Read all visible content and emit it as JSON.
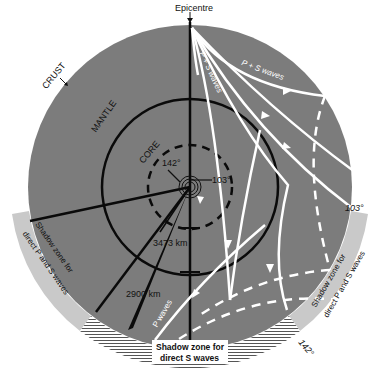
{
  "labels": {
    "epicentre": "Epicentre",
    "crust": "CRUST",
    "mantle": "MANTLE",
    "core": "CORE",
    "angle_142_inner": "142°",
    "angle_103_inner": "103°",
    "angle_103_outer": "103°",
    "angle_142_outer": "142°",
    "core_radius": "3473 km",
    "mantle_depth": "2900 km",
    "ps_waves_1": "P + S waves",
    "ps_waves_2": "P + S waves",
    "p_waves": "P waves",
    "shadow_ps_left_1": "Shadow zone for",
    "shadow_ps_left_2": "direct P and S waves",
    "shadow_ps_right_1": "Shadow zone for",
    "shadow_ps_right_2": "direct P and S waves",
    "shadow_s_1": "Shadow zone for",
    "shadow_s_2": "direct S waves"
  },
  "colors": {
    "mantle": "#7c7c7c",
    "shadow_band": "#c9c9c9",
    "lines": "#0a0a0a",
    "waves": "#ffffff"
  }
}
